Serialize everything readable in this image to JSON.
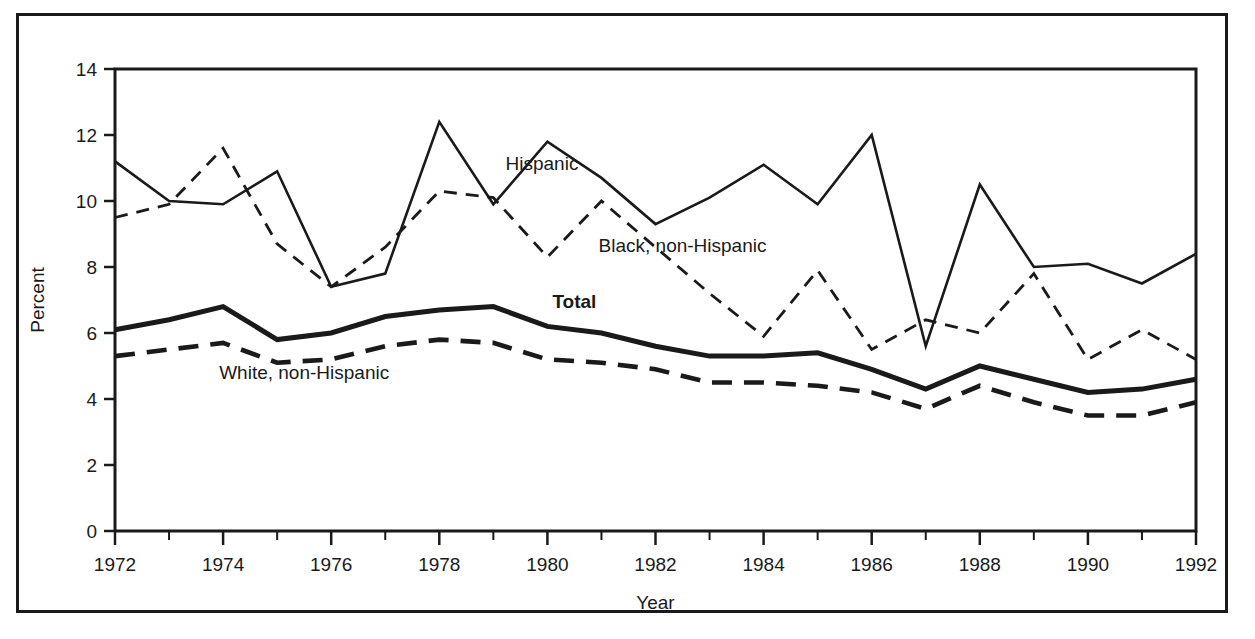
{
  "chart_data": {
    "type": "line",
    "title": "",
    "xlabel": "Year",
    "ylabel": "Percent",
    "xlim": [
      1972,
      1992
    ],
    "ylim": [
      0,
      14
    ],
    "ytick_step": 2,
    "xtick_step": 2,
    "minor_xtick_step": 1,
    "grid": false,
    "legend_position": "inline-annotations",
    "x": [
      1972,
      1973,
      1974,
      1975,
      1976,
      1977,
      1978,
      1979,
      1980,
      1981,
      1982,
      1983,
      1984,
      1985,
      1986,
      1987,
      1988,
      1989,
      1990,
      1991,
      1992
    ],
    "ytick_labels": [
      "0",
      "2",
      "4",
      "6",
      "8",
      "10",
      "12",
      "14"
    ],
    "xtick_labels": [
      "1972",
      "1974",
      "1976",
      "1978",
      "1980",
      "1982",
      "1984",
      "1986",
      "1988",
      "1990",
      "1992"
    ],
    "series": [
      {
        "name": "Hispanic",
        "style": "solid-thin",
        "color": "#1a1a1a",
        "label": "Hispanic",
        "label_x": 1979.9,
        "label_y": 10.95,
        "values": [
          11.2,
          10.0,
          9.9,
          10.9,
          7.4,
          7.8,
          12.4,
          9.9,
          11.8,
          10.7,
          9.3,
          10.1,
          11.1,
          9.9,
          12.0,
          5.6,
          10.5,
          8.0,
          8.1,
          7.5,
          8.4
        ]
      },
      {
        "name": "Black, non-Hispanic",
        "style": "dashed-thin",
        "color": "#1a1a1a",
        "label": "Black, non-Hispanic",
        "label_x": 1982.5,
        "label_y": 8.45,
        "values": [
          9.5,
          9.9,
          11.6,
          8.7,
          7.4,
          8.6,
          10.3,
          10.1,
          8.3,
          10.0,
          8.6,
          7.2,
          5.9,
          7.9,
          5.5,
          6.4,
          6.0,
          7.8,
          5.2,
          6.1,
          5.2
        ]
      },
      {
        "name": "Total",
        "style": "solid-thick",
        "color": "#1a1a1a",
        "label": "Total",
        "label_x": 1980.5,
        "label_y": 6.75,
        "values": [
          6.1,
          6.4,
          6.8,
          5.8,
          6.0,
          6.5,
          6.7,
          6.8,
          6.2,
          6.0,
          5.6,
          5.3,
          5.3,
          5.4,
          4.9,
          4.3,
          5.0,
          4.6,
          4.2,
          4.3,
          4.6
        ]
      },
      {
        "name": "White, non-Hispanic",
        "style": "dashed-thick",
        "color": "#1a1a1a",
        "label": "White, non-Hispanic",
        "label_x": 1975.5,
        "label_y": 4.62,
        "values": [
          5.3,
          5.5,
          5.7,
          5.1,
          5.2,
          5.6,
          5.8,
          5.7,
          5.2,
          5.1,
          4.9,
          4.5,
          4.5,
          4.4,
          4.2,
          3.7,
          4.4,
          3.9,
          3.5,
          3.5,
          3.9
        ]
      }
    ]
  }
}
